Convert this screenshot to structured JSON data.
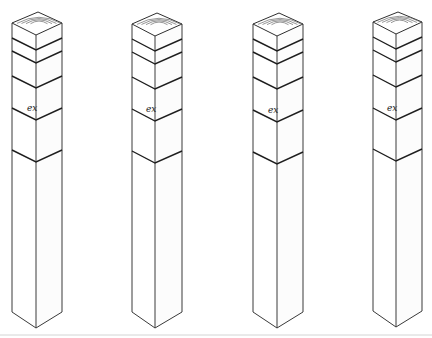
{
  "figure": {
    "colors": {
      "background": "#ffffff",
      "line": "#2a2a2a",
      "baseline": "#d4d4d4"
    },
    "posts": [
      {
        "id": 1,
        "mark_label": "ex",
        "left_x": 12,
        "center_x": 36,
        "right_x": 62,
        "top_apex_y": 12,
        "top_side_y": 23,
        "top_front_y": 35,
        "bottom_side_y": 312,
        "tip_y": 328,
        "band_center_ys": [
          50,
          63,
          88,
          120,
          162
        ],
        "mark_y": 108
      },
      {
        "id": 2,
        "mark_label": "ex",
        "left_x": 132,
        "center_x": 155,
        "right_x": 182,
        "top_apex_y": 13,
        "top_side_y": 24,
        "top_front_y": 36,
        "bottom_side_y": 312,
        "tip_y": 328,
        "band_center_ys": [
          51,
          64,
          89,
          121,
          163
        ],
        "mark_y": 109
      },
      {
        "id": 3,
        "mark_label": "ex",
        "left_x": 253,
        "center_x": 277,
        "right_x": 303,
        "top_apex_y": 13,
        "top_side_y": 24,
        "top_front_y": 36,
        "bottom_side_y": 312,
        "tip_y": 328,
        "band_center_ys": [
          51,
          64,
          89,
          122,
          164
        ],
        "mark_y": 110
      },
      {
        "id": 4,
        "mark_label": "ex",
        "left_x": 373,
        "center_x": 396,
        "right_x": 422,
        "top_apex_y": 12,
        "top_side_y": 22,
        "top_front_y": 34,
        "bottom_side_y": 311,
        "tip_y": 327,
        "band_center_ys": [
          49,
          62,
          87,
          120,
          161
        ],
        "mark_y": 108
      }
    ]
  }
}
